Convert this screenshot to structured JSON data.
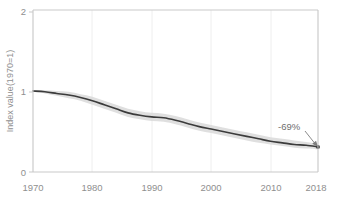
{
  "chart_data": {
    "type": "line",
    "title": "",
    "xlabel": "",
    "ylabel": "Index value(1970=1)",
    "xlim": [
      1970,
      2018
    ],
    "ylim": [
      0,
      2
    ],
    "grid": true,
    "grid_axis": "x",
    "legend": "none",
    "x_ticks": [
      "1970",
      "1980",
      "1990",
      "2000",
      "2010",
      "2018"
    ],
    "x_tick_values": [
      1970,
      1980,
      1990,
      2000,
      2010,
      2018
    ],
    "y_ticks": [
      "0",
      "1",
      "2"
    ],
    "y_tick_values": [
      0,
      1,
      2
    ],
    "x": [
      1970,
      1972,
      1974,
      1976,
      1978,
      1980,
      1982,
      1984,
      1986,
      1988,
      1990,
      1992,
      1994,
      1996,
      1998,
      2000,
      2002,
      2004,
      2006,
      2008,
      2010,
      2012,
      2014,
      2016,
      2018
    ],
    "series": [
      {
        "name": "Index value",
        "values": [
          1.0,
          0.99,
          0.97,
          0.95,
          0.92,
          0.88,
          0.83,
          0.78,
          0.73,
          0.7,
          0.68,
          0.67,
          0.64,
          0.6,
          0.56,
          0.53,
          0.5,
          0.47,
          0.44,
          0.41,
          0.38,
          0.36,
          0.34,
          0.33,
          0.31
        ],
        "color": "#3b3b3b"
      }
    ],
    "confidence_band": {
      "name": "uncertainty range",
      "color": "#d9d9d9",
      "lower": [
        0.99,
        0.97,
        0.94,
        0.91,
        0.88,
        0.83,
        0.78,
        0.73,
        0.68,
        0.65,
        0.63,
        0.62,
        0.59,
        0.55,
        0.51,
        0.48,
        0.45,
        0.42,
        0.39,
        0.36,
        0.34,
        0.32,
        0.3,
        0.29,
        0.28
      ],
      "upper": [
        1.01,
        1.01,
        1.0,
        0.99,
        0.96,
        0.93,
        0.88,
        0.83,
        0.78,
        0.75,
        0.73,
        0.72,
        0.69,
        0.65,
        0.61,
        0.58,
        0.55,
        0.52,
        0.49,
        0.46,
        0.43,
        0.41,
        0.39,
        0.37,
        0.35
      ]
    },
    "annotations": [
      {
        "name": "percent-change-callout",
        "label": "-69%",
        "points_to_x": 2018,
        "points_to_y": 0.31
      }
    ],
    "end_marker": {
      "x": 2018,
      "y": 0.31
    }
  },
  "axis": {
    "y_label": "Index value(1970=1)",
    "y_tick_top": "2",
    "y_tick_mid": "1",
    "y_tick_bottom": "0",
    "x_tick_1": "1970",
    "x_tick_2": "1980",
    "x_tick_3": "1990",
    "x_tick_4": "2000",
    "x_tick_5": "2010",
    "x_tick_6": "2018"
  },
  "annotation": {
    "change_label": "-69%"
  },
  "colors": {
    "line": "#3b3b3b",
    "band": "#d9d9d9",
    "frame": "#c8c8c8",
    "grid": "#ededed",
    "text": "#8f8f8f",
    "background": "#ffffff"
  }
}
